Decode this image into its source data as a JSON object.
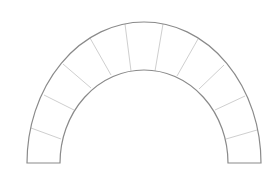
{
  "diagram": {
    "type": "semicircular-arch",
    "colors": {
      "outline": "#8a8a8a",
      "joints": "#cfcfcf",
      "background": "#ffffff"
    },
    "center": [
      144,
      163
    ],
    "outer": {
      "rx": 117,
      "ry": 141
    },
    "inner": {
      "rx": 84,
      "ry": 93
    },
    "base_y": 163,
    "voussoir_count": 11,
    "joints": [
      {
        "x1": 31,
        "y1": 128,
        "x2": 61,
        "y2": 139
      },
      {
        "x1": 44,
        "y1": 95,
        "x2": 74,
        "y2": 110
      },
      {
        "x1": 63,
        "y1": 64,
        "x2": 91,
        "y2": 88
      },
      {
        "x1": 90,
        "y1": 38,
        "x2": 111,
        "y2": 75
      },
      {
        "x1": 125,
        "y1": 24,
        "x2": 131,
        "y2": 71
      },
      {
        "x1": 163,
        "y1": 24,
        "x2": 155,
        "y2": 71
      },
      {
        "x1": 198,
        "y1": 39,
        "x2": 177,
        "y2": 76
      },
      {
        "x1": 224,
        "y1": 65,
        "x2": 199,
        "y2": 89
      },
      {
        "x1": 245,
        "y1": 96,
        "x2": 215,
        "y2": 110
      },
      {
        "x1": 257,
        "y1": 130,
        "x2": 226,
        "y2": 139
      }
    ]
  }
}
